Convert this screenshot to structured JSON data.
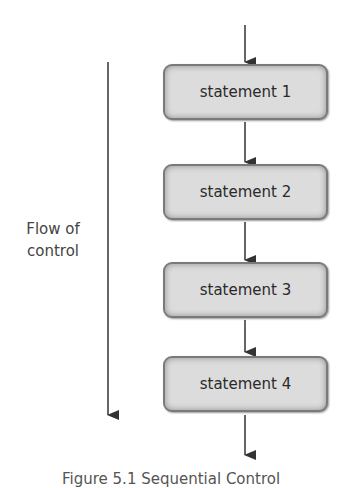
{
  "diagram": {
    "type": "flowchart",
    "flow_label_line1": "Flow of",
    "flow_label_line2": "control",
    "statements": [
      {
        "label": "statement 1"
      },
      {
        "label": "statement 2"
      },
      {
        "label": "statement 3"
      },
      {
        "label": "statement 4"
      }
    ],
    "caption": "Figure 5.1 Sequential Control"
  }
}
